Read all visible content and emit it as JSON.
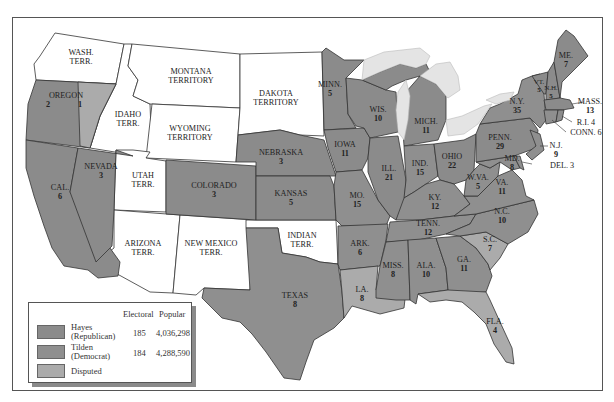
{
  "colors": {
    "hayes": "#8b8b8b",
    "tilden": "#8f8f8f",
    "disputed": "#ababab",
    "territory": "#ffffff",
    "lake": "#e4e4e4",
    "border": "#333333"
  },
  "legend": {
    "col_electoral": "Electoral",
    "col_popular": "Popular",
    "rows": [
      {
        "name_line1": "Hayes",
        "name_line2": "(Republican)",
        "electoral": "185",
        "popular": "4,036,298",
        "color_key": "hayes"
      },
      {
        "name_line1": "Tilden",
        "name_line2": "(Democrat)",
        "electoral": "184",
        "popular": "4,288,590",
        "color_key": "tilden"
      },
      {
        "name_line1": "Disputed",
        "name_line2": "",
        "electoral": "",
        "popular": "",
        "color_key": "disputed"
      }
    ]
  },
  "regions": {
    "wash": {
      "name": "WASH.",
      "name2": "TERR.",
      "votes": ""
    },
    "oregon": {
      "name": "OREGON",
      "votes": "2",
      "disputed_votes": "1"
    },
    "idaho": {
      "name": "IDAHO",
      "name2": "TERR.",
      "votes": ""
    },
    "montana": {
      "name": "MONTANA",
      "name2": "TERRITORY",
      "votes": ""
    },
    "wyoming": {
      "name": "WYOMING",
      "name2": "TERRITORY",
      "votes": ""
    },
    "dakota": {
      "name": "DAKOTA",
      "name2": "TERRITORY",
      "votes": ""
    },
    "utah": {
      "name": "UTAH",
      "name2": "TERR.",
      "votes": ""
    },
    "arizona": {
      "name": "ARIZONA",
      "name2": "TERR.",
      "votes": ""
    },
    "newmexico": {
      "name": "NEW MEXICO",
      "name2": "TERR.",
      "votes": ""
    },
    "indian": {
      "name": "INDIAN",
      "name2": "TERR.",
      "votes": ""
    },
    "cal": {
      "name": "CAL.",
      "votes": "6"
    },
    "nevada": {
      "name": "NEVADA",
      "votes": "3"
    },
    "colorado": {
      "name": "COLORADO",
      "votes": "3"
    },
    "nebraska": {
      "name": "NEBRASKA",
      "votes": "3"
    },
    "kansas": {
      "name": "KANSAS",
      "votes": "5"
    },
    "texas": {
      "name": "TEXAS",
      "votes": "8"
    },
    "minn": {
      "name": "MINN.",
      "votes": "5"
    },
    "iowa": {
      "name": "IOWA",
      "votes": "11"
    },
    "mo": {
      "name": "MO.",
      "votes": "15"
    },
    "ark": {
      "name": "ARK.",
      "votes": "6"
    },
    "la": {
      "name": "LA.",
      "votes": "8"
    },
    "wis": {
      "name": "WIS.",
      "votes": "10"
    },
    "ill": {
      "name": "ILL.",
      "votes": "21"
    },
    "mich": {
      "name": "MICH.",
      "votes": "11"
    },
    "ind": {
      "name": "IND.",
      "votes": "15"
    },
    "ohio": {
      "name": "OHIO",
      "votes": "22"
    },
    "ky": {
      "name": "KY.",
      "votes": "12"
    },
    "tenn": {
      "name": "TENN.",
      "votes": "12"
    },
    "miss": {
      "name": "MISS.",
      "votes": "8"
    },
    "ala": {
      "name": "ALA.",
      "votes": "10"
    },
    "ga": {
      "name": "GA.",
      "votes": "11"
    },
    "fla": {
      "name": "FLA.",
      "votes": "4"
    },
    "sc": {
      "name": "S.C.",
      "votes": "7"
    },
    "nc": {
      "name": "N.C.",
      "votes": "10"
    },
    "va": {
      "name": "VA.",
      "votes": "11"
    },
    "wva": {
      "name": "W.VA.",
      "votes": "5"
    },
    "md": {
      "name": "MD.",
      "votes": "8"
    },
    "del": {
      "name": "DEL. 3"
    },
    "nj": {
      "name": "N.J.",
      "votes": "9"
    },
    "penn": {
      "name": "PENN.",
      "votes": "29"
    },
    "ny": {
      "name": "N.Y.",
      "votes": "35"
    },
    "vt": {
      "name": "VT.",
      "votes": "5"
    },
    "nh": {
      "name": "N.H.",
      "votes": "5"
    },
    "me": {
      "name": "ME.",
      "votes": "7"
    },
    "mass": {
      "name": "MASS.",
      "votes": "13"
    },
    "ri": {
      "name": "R.I. 4"
    },
    "conn": {
      "name": "CONN. 6"
    }
  }
}
